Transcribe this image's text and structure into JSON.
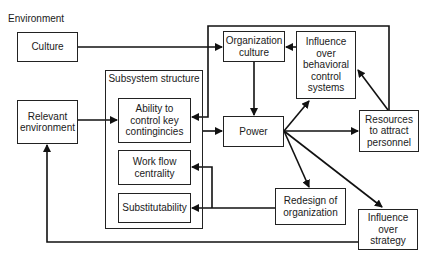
{
  "diagram": {
    "section_label": "Environment",
    "nodes": {
      "culture": "Culture",
      "relevant_environment": "Relevant environment",
      "subsystem_structure": "Subsystem structure",
      "ability": "Ability to control key contingincies",
      "work_flow": "Work flow centrality",
      "substitutability": "Substitutability",
      "organization_culture": "Organization culture",
      "influence_behavioral": "Influence over behavioral control systems",
      "power": "Power",
      "resources": "Resources to attract personnel",
      "redesign": "Redesign of organization",
      "influence_strategy": "Influence over strategy"
    },
    "edges": [
      {
        "from": "Culture",
        "to": "Organization culture"
      },
      {
        "from": "Relevant environment",
        "to": "Subsystem structure"
      },
      {
        "from": "Resources to attract personnel",
        "to": "Ability to control key contingincies"
      },
      {
        "from": "Organization culture",
        "to": "Power"
      },
      {
        "from": "Influence over behavioral control systems",
        "to": "Organization culture"
      },
      {
        "from": "Subsystem structure",
        "to": "Power"
      },
      {
        "from": "Power",
        "to": "Influence over behavioral control systems"
      },
      {
        "from": "Power",
        "to": "Resources to attract personnel"
      },
      {
        "from": "Power",
        "to": "Redesign of organization"
      },
      {
        "from": "Power",
        "to": "Influence over strategy"
      },
      {
        "from": "Resources to attract personnel",
        "to": "Influence over behavioral control systems"
      },
      {
        "from": "Redesign of organization",
        "to": "Work flow centrality"
      },
      {
        "from": "Redesign of organization",
        "to": "Substitutability"
      },
      {
        "from": "Influence over strategy",
        "to": "Relevant environment"
      }
    ]
  }
}
